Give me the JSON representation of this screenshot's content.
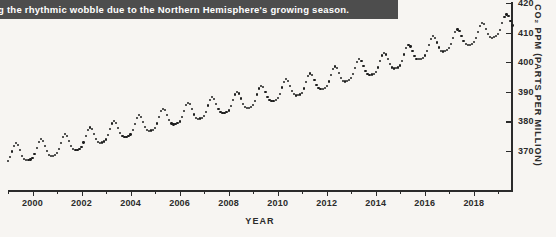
{
  "caption": {
    "text": "g the rhythmic wobble due to the Northern Hemisphere's growing season.",
    "background_color": "#4d4d4d",
    "text_color": "#ffffff"
  },
  "chart_data": {
    "type": "scatter",
    "title": "",
    "xlabel": "YEAR",
    "ylabel": "CO₂ PPM (PARTS PER MILLION)",
    "xlim": [
      1999.0,
      2019.6
    ],
    "ylim": [
      363,
      421
    ],
    "x_tick_labels": [
      "2000",
      "2002",
      "2004",
      "2006",
      "2008",
      "2010",
      "2012",
      "2014",
      "2016",
      "2018"
    ],
    "x_tick_values": [
      2000,
      2002,
      2004,
      2006,
      2008,
      2010,
      2012,
      2014,
      2016,
      2018
    ],
    "x_minor_tick_values": [
      1999,
      2001,
      2003,
      2005,
      2007,
      2009,
      2011,
      2013,
      2015,
      2017,
      2019
    ],
    "y_tick_labels": [
      "370",
      "380",
      "390",
      "400",
      "410",
      "420"
    ],
    "y_tick_values": [
      370,
      380,
      390,
      400,
      410,
      420
    ],
    "grid": false,
    "legend": false,
    "marker_color": "#1e1e1e",
    "series_name": "Atmospheric CO2 monthly mean",
    "annual_means": [
      368.4,
      369.6,
      371.2,
      373.3,
      375.8,
      377.5,
      379.8,
      381.9,
      383.8,
      385.6,
      387.4,
      389.9,
      391.6,
      393.9,
      396.5,
      398.7,
      400.8,
      404.2,
      406.6,
      408.6,
      411.4
    ],
    "seasonal_amplitude_ppm": 6.3,
    "seasonal_peak_month": 5,
    "points_per_year": 12,
    "start_year": 1999,
    "end_year": 2019
  }
}
